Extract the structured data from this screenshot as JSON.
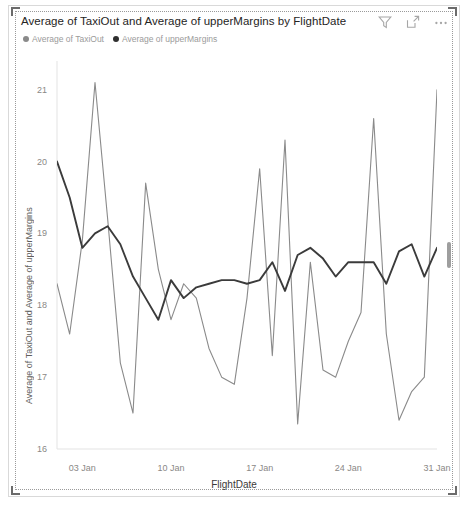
{
  "visual": {
    "title": "Average of TaxiOut and Average of upperMargins by FlightDate",
    "header_icons": [
      {
        "name": "filter-icon",
        "label": "Filters"
      },
      {
        "name": "focus-mode-icon",
        "label": "Focus mode"
      },
      {
        "name": "more-options-icon",
        "label": "More options"
      }
    ]
  },
  "legend": {
    "items": [
      {
        "label": "Average of TaxiOut",
        "color": "#8a8a8a"
      },
      {
        "label": "Average of upperMargins",
        "color": "#3b3b3b"
      }
    ]
  },
  "chart_data": {
    "type": "line",
    "title": "Average of TaxiOut and Average of upperMargins by FlightDate",
    "xlabel": "FlightDate",
    "ylabel": "Average of TaxiOut and Average of upperMargins",
    "grid": false,
    "legend_position": "top-left",
    "ylim": [
      16,
      21.4
    ],
    "yticks": [
      16,
      17,
      18,
      19,
      20,
      21
    ],
    "ytick_labels": [
      "16",
      "17",
      "18",
      "19",
      "20",
      "21"
    ],
    "xticks": [
      "03 Jan",
      "10 Jan",
      "17 Jan",
      "24 Jan",
      "31 Jan"
    ],
    "xtick_positions": [
      2,
      9,
      16,
      23,
      30
    ],
    "x": [
      0,
      1,
      2,
      3,
      4,
      5,
      6,
      7,
      8,
      9,
      10,
      11,
      12,
      13,
      14,
      15,
      16,
      17,
      18,
      19,
      20,
      21,
      22,
      23,
      24,
      25,
      26,
      27,
      28,
      29,
      30
    ],
    "series": [
      {
        "name": "Average of TaxiOut",
        "color": "#8a8a8a",
        "values": [
          18.3,
          17.6,
          18.9,
          21.1,
          19.2,
          17.2,
          16.5,
          19.7,
          18.5,
          17.8,
          18.3,
          18.1,
          17.4,
          17.0,
          16.9,
          18.1,
          19.9,
          17.3,
          20.3,
          16.35,
          18.6,
          17.1,
          17.0,
          17.5,
          17.9,
          20.6,
          17.6,
          16.4,
          16.8,
          17.0,
          21.0
        ]
      },
      {
        "name": "Average of upperMargins",
        "color": "#3b3b3b",
        "values": [
          20.0,
          19.5,
          18.8,
          19.0,
          19.1,
          18.85,
          18.4,
          18.1,
          17.8,
          18.35,
          18.1,
          18.25,
          18.3,
          18.35,
          18.35,
          18.3,
          18.35,
          18.6,
          18.2,
          18.7,
          18.8,
          18.65,
          18.4,
          18.6,
          18.6,
          18.6,
          18.3,
          18.75,
          18.85,
          18.4,
          18.8
        ]
      }
    ]
  }
}
